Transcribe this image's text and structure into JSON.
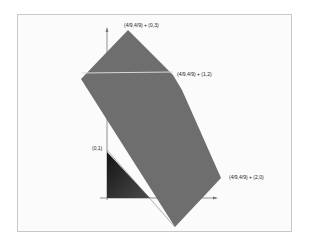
{
  "diagram": {
    "type": "geometric-polytope",
    "labels": {
      "top": "(4/9,4/9) + (0,3)",
      "right_upper": "(4/9,4/9) + (1,2)",
      "right_lower": "(4/9,4/9) + (2,0)",
      "axis_point": "(0,1)"
    },
    "colors": {
      "polygon_fill": "#6e6e6e",
      "triangle_fill": "#2a2a2a",
      "highlight_line": "#d8d8d8",
      "axes": "#777777",
      "frame_border": "#c8c8c8"
    }
  }
}
